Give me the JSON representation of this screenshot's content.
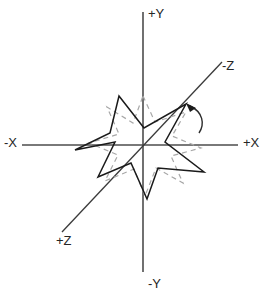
{
  "figure": {
    "background_color": "#ffffff",
    "origin": {
      "x": 143,
      "y": 145
    }
  },
  "axes": {
    "color": "#4d4d4d",
    "diagonal_color": "#3a3a3a",
    "labels": {
      "x_positive": "+X",
      "x_negative": "-X",
      "y_positive": "+Y",
      "y_negative": "-Y",
      "z_positive": "+Z",
      "z_negative": "-Z"
    },
    "label_positions": {
      "x_positive": {
        "x": 243,
        "y": 147
      },
      "x_negative": {
        "x": 4,
        "y": 147
      },
      "y_positive": {
        "x": 146,
        "y": 18
      },
      "y_negative": {
        "x": 146,
        "y": 288
      },
      "z_positive": {
        "x": 56,
        "y": 245
      },
      "z_negative": {
        "x": 222,
        "y": 70
      }
    }
  },
  "shapes": {
    "star_original": {
      "name": "dashed-gray-star",
      "style": "dashed",
      "color": "#a8a8a8",
      "points": 6,
      "description": "original un-rotated star outline"
    },
    "star_rotated": {
      "name": "solid-black-star",
      "style": "solid",
      "color": "#1a1a1a",
      "points": 6,
      "description": "star outline after rotation about the -Z axis"
    }
  },
  "annotations": {
    "rotation_arrow": {
      "name": "rotation-arc-arrow",
      "color": "#2b2b2b",
      "direction": "counter-clockwise about -Z",
      "arrow_tip": {
        "x": 186,
        "y": 104
      }
    }
  },
  "chart_data": {
    "type": "scatter",
    "xlabel": "X",
    "ylabel": "Y",
    "grid": false,
    "legend": "none",
    "axis_rays": [
      {
        "name": "+X",
        "from": [
          143,
          145
        ],
        "to": [
          238,
          145
        ]
      },
      {
        "name": "-X",
        "from": [
          143,
          145
        ],
        "to": [
          22,
          145
        ]
      },
      {
        "name": "+Y",
        "from": [
          143,
          145
        ],
        "to": [
          143,
          12
        ]
      },
      {
        "name": "-Y",
        "from": [
          143,
          145
        ],
        "to": [
          143,
          272
        ]
      },
      {
        "name": "-Z",
        "from": [
          143,
          145
        ],
        "to": [
          222,
          62
        ]
      },
      {
        "name": "+Z",
        "from": [
          143,
          145
        ],
        "to": [
          62,
          232
        ]
      }
    ],
    "series": [
      {
        "name": "dashed-gray-star",
        "closed": true,
        "values": [
          [
            143,
            96
          ],
          [
            155,
            122
          ],
          [
            186,
            112
          ],
          [
            172,
            136
          ],
          [
            201,
            148
          ],
          [
            171,
            156
          ],
          [
            183,
            183
          ],
          [
            156,
            168
          ],
          [
            145,
            196
          ],
          [
            134,
            169
          ],
          [
            105,
            181
          ],
          [
            118,
            155
          ],
          [
            89,
            143
          ],
          [
            119,
            134
          ],
          [
            107,
            107
          ],
          [
            133,
            123
          ]
        ]
      },
      {
        "name": "solid-black-star",
        "closed": true,
        "values": [
          [
            119,
            96
          ],
          [
            144,
            128
          ],
          [
            186,
            104
          ],
          [
            165,
            142
          ],
          [
            204,
            172
          ],
          [
            158,
            168
          ],
          [
            147,
            199
          ],
          [
            131,
            163
          ],
          [
            98,
            177
          ],
          [
            115,
            142
          ],
          [
            75,
            150
          ],
          [
            110,
            133
          ]
        ]
      }
    ]
  }
}
